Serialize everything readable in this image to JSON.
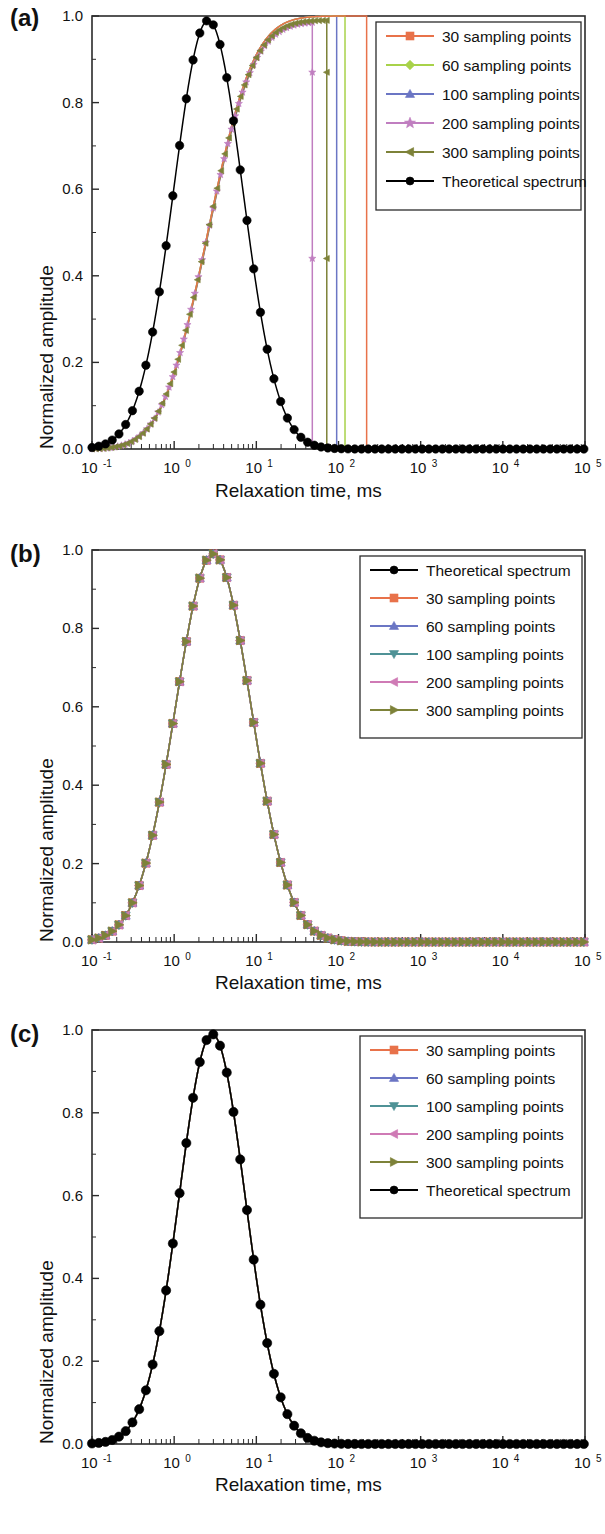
{
  "figure": {
    "panels": [
      "a",
      "b",
      "c"
    ],
    "axis": {
      "xlabel": "Relaxation time, ms",
      "ylabel": "Normalized amplitude",
      "x_tick_labels": [
        "10-1",
        "100",
        "101",
        "102",
        "103",
        "104",
        "105"
      ],
      "x_tick_mantissa": "10",
      "x_tick_exponents": [
        "-1",
        "0",
        "1",
        "2",
        "3",
        "4",
        "5"
      ],
      "y_tick_labels": [
        "0.0",
        "0.2",
        "0.4",
        "0.6",
        "0.8",
        "1.0"
      ]
    },
    "colors": {
      "c30": "#e8724a",
      "c60_a": "#a8d24a",
      "c60_bc": "#6b76c4",
      "c100_a": "#6b76c4",
      "c100_bc": "#4f9296",
      "c200_a": "#c07ec0",
      "c200_bc": "#cf7ab5",
      "c300": "#7d8239",
      "theory": "#000000"
    }
  },
  "panel_a": {
    "label": "(a)",
    "legend": [
      {
        "label": "30 sampling points",
        "color": "#e8724a",
        "marker": "square"
      },
      {
        "label": "60 sampling points",
        "color": "#a8d24a",
        "marker": "diamond"
      },
      {
        "label": "100 sampling points",
        "color": "#6b76c4",
        "marker": "triangle-up"
      },
      {
        "label": "200 sampling points",
        "color": "#c07ec0",
        "marker": "star"
      },
      {
        "label": "300 sampling points",
        "color": "#7d8239",
        "marker": "triangle-left"
      },
      {
        "label": "Theoretical  spectrum",
        "color": "#000000",
        "marker": "circle"
      }
    ]
  },
  "panel_b": {
    "label": "(b)",
    "legend": [
      {
        "label": "Theoretical  spectrum",
        "color": "#000000",
        "marker": "circle"
      },
      {
        "label": "30 sampling points",
        "color": "#e8724a",
        "marker": "square"
      },
      {
        "label": "60 sampling points",
        "color": "#6b76c4",
        "marker": "triangle-up"
      },
      {
        "label": "100 sampling points",
        "color": "#4f9296",
        "marker": "triangle-down"
      },
      {
        "label": "200 sampling points",
        "color": "#cf7ab5",
        "marker": "triangle-left"
      },
      {
        "label": "300 sampling points",
        "color": "#7d8239",
        "marker": "triangle-right"
      }
    ]
  },
  "panel_c": {
    "label": "(c)",
    "legend": [
      {
        "label": "30 sampling points",
        "color": "#e8724a",
        "marker": "square"
      },
      {
        "label": "60 sampling points",
        "color": "#6b76c4",
        "marker": "triangle-up"
      },
      {
        "label": "100 sampling points",
        "color": "#4f9296",
        "marker": "triangle-down"
      },
      {
        "label": "200 sampling points",
        "color": "#cf7ab5",
        "marker": "triangle-left"
      },
      {
        "label": "300 sampling points",
        "color": "#7d8239",
        "marker": "triangle-right"
      },
      {
        "label": "Theoretical  spectrum",
        "color": "#000000",
        "marker": "circle"
      }
    ]
  },
  "chart_data": [
    {
      "panel": "a",
      "type": "line",
      "title": "(a)",
      "xlabel": "Relaxation time, ms",
      "ylabel": "Normalized amplitude",
      "xscale": "log",
      "xlim": [
        0.1,
        100000
      ],
      "ylim": [
        0.0,
        1.0
      ],
      "grid": false,
      "legend_position": "top-right-inside",
      "series": [
        {
          "name": "Theoretical  spectrum",
          "color": "#000000",
          "marker": "circle",
          "comment": "log-normal peak, centre 2.6 ms, sigma 0.42 decades, max 0.99",
          "peak_x": 2.6,
          "peak_y": 0.99,
          "sigma_decades": 0.42
        },
        {
          "name": "30 sampling points",
          "color": "#e8724a",
          "marker": "square",
          "comment": "saturating rise to 1.0 then vertical drop to 0 at cutoff",
          "cutoff_x": 220,
          "plateau_y": 1.0
        },
        {
          "name": "60 sampling points",
          "color": "#a8d24a",
          "marker": "diamond",
          "cutoff_x": 120,
          "plateau_y": 1.0
        },
        {
          "name": "100 sampling points",
          "color": "#6b76c4",
          "marker": "triangle-up",
          "cutoff_x": 95,
          "plateau_y": 1.0
        },
        {
          "name": "200 sampling points",
          "color": "#c07ec0",
          "marker": "star",
          "cutoff_x": 48,
          "plateau_y": 0.985
        },
        {
          "name": "300 sampling points",
          "color": "#7d8239",
          "marker": "triangle-left",
          "cutoff_x": 72,
          "plateau_y": 0.99
        }
      ]
    },
    {
      "panel": "b",
      "type": "line",
      "title": "(b)",
      "xlabel": "Relaxation time, ms",
      "ylabel": "Normalized amplitude",
      "xscale": "log",
      "xlim": [
        0.1,
        100000
      ],
      "ylim": [
        0.0,
        1.0
      ],
      "grid": false,
      "legend_position": "top-right-inside",
      "comment": "all six series overlap on the same log-normal peak",
      "series": [
        {
          "name": "Theoretical  spectrum",
          "color": "#000000",
          "marker": "circle",
          "peak_x": 3.0,
          "peak_y": 0.99,
          "sigma_decades": 0.46
        },
        {
          "name": "30 sampling points",
          "color": "#e8724a",
          "marker": "square",
          "peak_x": 3.0,
          "peak_y": 0.99,
          "sigma_decades": 0.46
        },
        {
          "name": "60 sampling points",
          "color": "#6b76c4",
          "marker": "triangle-up",
          "peak_x": 3.0,
          "peak_y": 0.99,
          "sigma_decades": 0.46
        },
        {
          "name": "100 sampling points",
          "color": "#4f9296",
          "marker": "triangle-down",
          "peak_x": 3.0,
          "peak_y": 0.99,
          "sigma_decades": 0.46
        },
        {
          "name": "200 sampling points",
          "color": "#cf7ab5",
          "marker": "triangle-left",
          "peak_x": 3.0,
          "peak_y": 0.99,
          "sigma_decades": 0.46
        },
        {
          "name": "300 sampling points",
          "color": "#7d8239",
          "marker": "triangle-right",
          "peak_x": 3.0,
          "peak_y": 0.99,
          "sigma_decades": 0.46
        }
      ]
    },
    {
      "panel": "c",
      "type": "line",
      "title": "(c)",
      "xlabel": "Relaxation time, ms",
      "ylabel": "Normalized amplitude",
      "xscale": "log",
      "xlim": [
        0.1,
        100000
      ],
      "ylim": [
        0.0,
        1.0
      ],
      "grid": false,
      "legend_position": "top-right-inside",
      "comment": "only the black theoretical spectrum is visible; sampled series coincide beneath it",
      "series": [
        {
          "name": "30 sampling points",
          "color": "#e8724a",
          "marker": "square",
          "peak_x": 2.9,
          "peak_y": 0.99,
          "sigma_decades": 0.4
        },
        {
          "name": "60 sampling points",
          "color": "#6b76c4",
          "marker": "triangle-up",
          "peak_x": 2.9,
          "peak_y": 0.99,
          "sigma_decades": 0.4
        },
        {
          "name": "100 sampling points",
          "color": "#4f9296",
          "marker": "triangle-down",
          "peak_x": 2.9,
          "peak_y": 0.99,
          "sigma_decades": 0.4
        },
        {
          "name": "200 sampling points",
          "color": "#cf7ab5",
          "marker": "triangle-left",
          "peak_x": 2.9,
          "peak_y": 0.99,
          "sigma_decades": 0.4
        },
        {
          "name": "300 sampling points",
          "color": "#7d8239",
          "marker": "triangle-right",
          "peak_x": 2.9,
          "peak_y": 0.99,
          "sigma_decades": 0.4
        },
        {
          "name": "Theoretical  spectrum",
          "color": "#000000",
          "marker": "circle",
          "peak_x": 2.9,
          "peak_y": 0.99,
          "sigma_decades": 0.4
        }
      ]
    }
  ]
}
